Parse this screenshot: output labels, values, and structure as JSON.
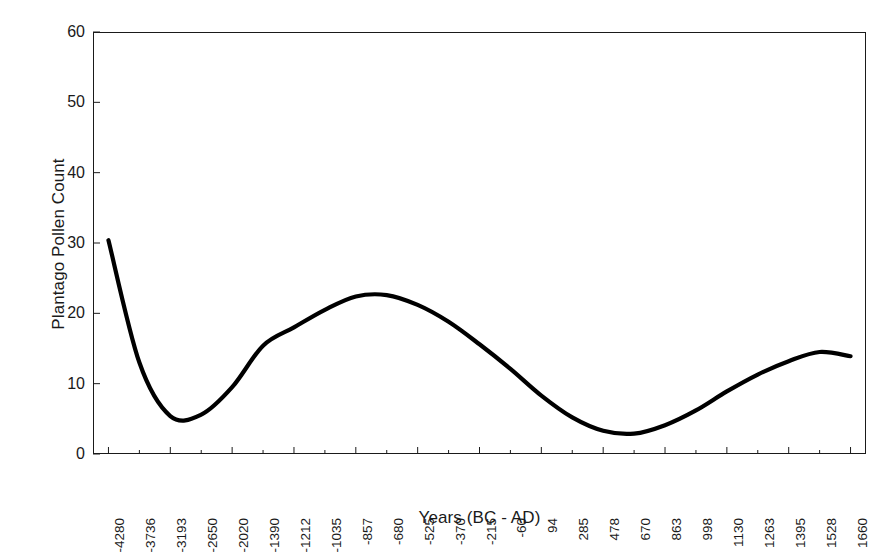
{
  "chart_data": {
    "type": "line",
    "title": "",
    "xlabel": "Years (BC - AD)",
    "ylabel": "Plantago Pollen Count",
    "ylim": [
      0,
      60
    ],
    "yticks": [
      0,
      10,
      20,
      30,
      40,
      50,
      60
    ],
    "grid": false,
    "legend": false,
    "legend_position": "none",
    "line_color": "#000000",
    "line_width": 4.2,
    "background_color": "#ffffff",
    "axis_color": "#1a1a1a",
    "categories": [
      "-4280",
      "-3736",
      "-3193",
      "-2650",
      "-2020",
      "-1390",
      "-1212",
      "-1035",
      "-857",
      "-680",
      "-525",
      "-370",
      "-215",
      "-60",
      "94",
      "285",
      "478",
      "670",
      "863",
      "998",
      "1130",
      "1263",
      "1395",
      "1528",
      "1660"
    ],
    "series": [
      {
        "name": "Plantago Pollen Count",
        "values": [
          30.4,
          13.0,
          5.4,
          5.6,
          9.5,
          15.4,
          18.0,
          20.5,
          22.4,
          22.6,
          21.2,
          18.8,
          15.6,
          12.1,
          8.3,
          5.2,
          3.3,
          2.9,
          4.1,
          6.2,
          8.9,
          11.3,
          13.2,
          14.5,
          13.9
        ]
      }
    ],
    "annotations": []
  }
}
